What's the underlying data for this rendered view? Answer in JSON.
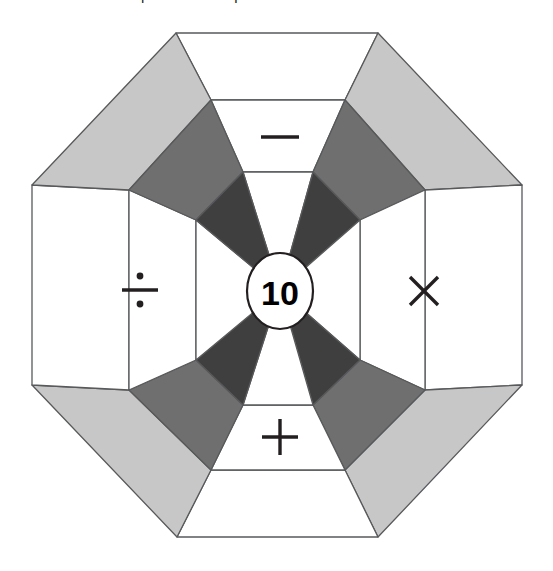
{
  "caption": {
    "text": "e them in the correct places on the p",
    "note": "top line of body text, vertically cropped by screenshot edge"
  },
  "diagram": {
    "name": "octagon-operation-target",
    "center_value": "10",
    "shape": "octagon",
    "sector_count": 8,
    "ring_count": 3,
    "operators": [
      {
        "position": "top",
        "symbol": "minus",
        "glyph": "−"
      },
      {
        "position": "right",
        "symbol": "multiply",
        "glyph": "×"
      },
      {
        "position": "bottom",
        "symbol": "plus",
        "glyph": "+"
      },
      {
        "position": "left",
        "symbol": "divide",
        "glyph": "÷"
      }
    ],
    "colors": {
      "background": "#ffffff",
      "outline": "#58595b",
      "ring_inner_shaded": "#3f3f3f",
      "ring_middle_shaded": "#6f6f6f",
      "ring_outer_shaded": "#c7c7c7",
      "ring_unshaded": "#ffffff",
      "center_circle_fill": "#ffffff",
      "text": "#231f20"
    },
    "geometry": {
      "center": [
        280,
        290
      ],
      "octagon_vertices": [
        [
          176,
          33
        ],
        [
          378,
          33
        ],
        [
          522,
          185
        ],
        [
          522,
          385
        ],
        [
          378,
          537
        ],
        [
          177,
          537
        ],
        [
          32,
          385
        ],
        [
          32,
          185
        ]
      ],
      "ring_fractions": [
        0.333,
        0.666,
        1.0
      ]
    }
  }
}
